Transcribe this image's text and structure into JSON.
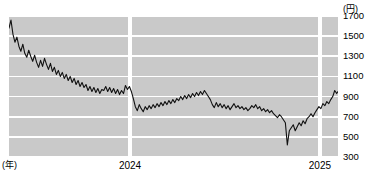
{
  "chart_data": {
    "type": "line",
    "title": "",
    "xlabel": "(年)",
    "ylabel": "",
    "yunit": "(円)",
    "ylim": [
      300,
      1700
    ],
    "yticks": [
      1700,
      1500,
      1300,
      1100,
      900,
      700,
      500,
      300
    ],
    "xticks": [
      {
        "label": "2024",
        "pos": 0.368
      },
      {
        "label": "2025",
        "pos": 0.945
      }
    ],
    "year_dividers": [
      0.368,
      0.945
    ],
    "grid": true,
    "legend": "none",
    "line_color": "#111111",
    "plot_bg": "#c9c9c9",
    "grid_color": "#ffffff",
    "x": [
      0.0,
      0.006,
      0.012,
      0.018,
      0.024,
      0.03,
      0.036,
      0.042,
      0.048,
      0.054,
      0.06,
      0.066,
      0.072,
      0.078,
      0.084,
      0.09,
      0.096,
      0.102,
      0.108,
      0.114,
      0.12,
      0.126,
      0.132,
      0.138,
      0.144,
      0.15,
      0.156,
      0.162,
      0.168,
      0.174,
      0.18,
      0.186,
      0.192,
      0.198,
      0.204,
      0.21,
      0.216,
      0.222,
      0.228,
      0.234,
      0.24,
      0.246,
      0.252,
      0.258,
      0.264,
      0.27,
      0.276,
      0.282,
      0.288,
      0.294,
      0.3,
      0.306,
      0.312,
      0.318,
      0.324,
      0.33,
      0.336,
      0.342,
      0.348,
      0.354,
      0.36,
      0.366,
      0.372,
      0.378,
      0.384,
      0.39,
      0.396,
      0.402,
      0.408,
      0.414,
      0.42,
      0.426,
      0.432,
      0.438,
      0.444,
      0.45,
      0.456,
      0.462,
      0.468,
      0.474,
      0.48,
      0.486,
      0.492,
      0.498,
      0.504,
      0.51,
      0.516,
      0.522,
      0.528,
      0.534,
      0.54,
      0.546,
      0.552,
      0.558,
      0.564,
      0.57,
      0.576,
      0.582,
      0.588,
      0.594,
      0.6,
      0.606,
      0.612,
      0.618,
      0.624,
      0.63,
      0.636,
      0.642,
      0.648,
      0.654,
      0.66,
      0.666,
      0.672,
      0.678,
      0.684,
      0.69,
      0.696,
      0.702,
      0.708,
      0.714,
      0.72,
      0.726,
      0.732,
      0.738,
      0.744,
      0.75,
      0.756,
      0.762,
      0.768,
      0.774,
      0.78,
      0.786,
      0.792,
      0.798,
      0.804,
      0.81,
      0.816,
      0.822,
      0.828,
      0.834,
      0.84,
      0.846,
      0.852,
      0.858,
      0.864,
      0.87,
      0.876,
      0.882,
      0.888,
      0.894,
      0.9,
      0.906,
      0.912,
      0.918,
      0.924,
      0.93,
      0.936,
      0.942,
      0.948,
      0.954,
      0.96,
      0.966,
      0.972,
      0.978,
      0.984,
      0.99,
      0.996,
      1.0
    ],
    "values": [
      1580,
      1660,
      1520,
      1440,
      1490,
      1400,
      1350,
      1420,
      1330,
      1290,
      1360,
      1300,
      1250,
      1310,
      1240,
      1190,
      1260,
      1200,
      1280,
      1220,
      1170,
      1230,
      1150,
      1190,
      1120,
      1160,
      1100,
      1140,
      1080,
      1120,
      1060,
      1100,
      1040,
      1080,
      1020,
      1060,
      1000,
      1040,
      990,
      1020,
      960,
      1000,
      950,
      990,
      940,
      980,
      930,
      970,
      960,
      1000,
      950,
      990,
      940,
      980,
      930,
      970,
      920,
      960,
      930,
      1010,
      970,
      1000,
      950,
      880,
      800,
      760,
      820,
      780,
      750,
      800,
      770,
      810,
      780,
      820,
      790,
      830,
      800,
      840,
      810,
      850,
      820,
      860,
      830,
      870,
      840,
      880,
      860,
      900,
      870,
      910,
      880,
      920,
      890,
      930,
      900,
      940,
      910,
      950,
      920,
      960,
      930,
      900,
      870,
      820,
      790,
      840,
      800,
      830,
      790,
      820,
      780,
      810,
      770,
      800,
      830,
      790,
      810,
      780,
      800,
      770,
      790,
      760,
      780,
      810,
      790,
      820,
      780,
      800,
      760,
      780,
      750,
      770,
      740,
      760,
      730,
      710,
      690,
      720,
      700,
      670,
      640,
      420,
      560,
      590,
      620,
      560,
      600,
      640,
      610,
      660,
      630,
      680,
      700,
      730,
      700,
      740,
      770,
      800,
      780,
      830,
      810,
      850,
      830,
      870,
      900,
      960,
      930,
      950
    ]
  }
}
